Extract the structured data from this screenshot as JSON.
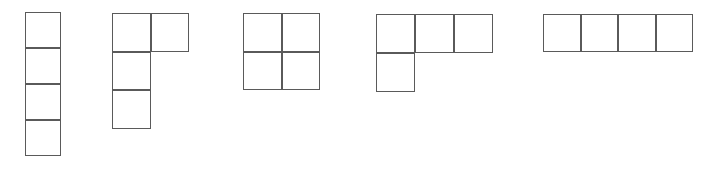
{
  "figure": {
    "kind": "polyomino-set-diagram",
    "background_color": "#ffffff",
    "stroke_color": "#5a5a5a",
    "stroke_width_px": 1.5,
    "canvas": {
      "width_px": 703,
      "height_px": 183
    },
    "caption": "",
    "shape_count": 5,
    "shapes": [
      {
        "id": "shape-1",
        "name": "vertical-i-tetromino",
        "label": "",
        "cell_count": 4,
        "grid_columns": 1,
        "grid_rows": 4,
        "cell_size_px": 36,
        "origin_px": {
          "x": 25,
          "y": 12
        },
        "cells": [
          {
            "col": 0,
            "row": 0
          },
          {
            "col": 0,
            "row": 1
          },
          {
            "col": 0,
            "row": 2
          },
          {
            "col": 0,
            "row": 3
          }
        ]
      },
      {
        "id": "shape-2",
        "name": "j-tetromino-vertical",
        "label": "",
        "cell_count": 4,
        "grid_columns": 2,
        "grid_rows": 3,
        "cell_size_px": 38.5,
        "origin_px": {
          "x": 112,
          "y": 13
        },
        "cells": [
          {
            "col": 0,
            "row": 0
          },
          {
            "col": 1,
            "row": 0
          },
          {
            "col": 0,
            "row": 1
          },
          {
            "col": 0,
            "row": 2
          }
        ]
      },
      {
        "id": "shape-3",
        "name": "o-tetromino-square",
        "label": "",
        "cell_count": 4,
        "grid_columns": 2,
        "grid_rows": 2,
        "cell_size_px": 38.5,
        "origin_px": {
          "x": 243,
          "y": 13
        },
        "cells": [
          {
            "col": 0,
            "row": 0
          },
          {
            "col": 1,
            "row": 0
          },
          {
            "col": 0,
            "row": 1
          },
          {
            "col": 1,
            "row": 1
          }
        ]
      },
      {
        "id": "shape-4",
        "name": "j-tetromino-horizontal",
        "label": "",
        "cell_count": 4,
        "grid_columns": 3,
        "grid_rows": 2,
        "cell_size_px": 39,
        "origin_px": {
          "x": 376,
          "y": 14
        },
        "cells": [
          {
            "col": 0,
            "row": 0
          },
          {
            "col": 1,
            "row": 0
          },
          {
            "col": 2,
            "row": 0
          },
          {
            "col": 0,
            "row": 1
          }
        ]
      },
      {
        "id": "shape-5",
        "name": "horizontal-i-tetromino",
        "label": "",
        "cell_count": 4,
        "grid_columns": 4,
        "grid_rows": 1,
        "cell_size_px": 37.5,
        "origin_px": {
          "x": 543,
          "y": 14
        },
        "cells": [
          {
            "col": 0,
            "row": 0
          },
          {
            "col": 1,
            "row": 0
          },
          {
            "col": 2,
            "row": 0
          },
          {
            "col": 3,
            "row": 0
          }
        ]
      }
    ]
  }
}
